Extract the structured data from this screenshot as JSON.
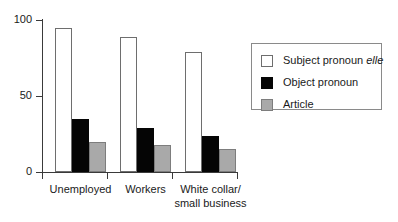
{
  "chart_data": {
    "type": "bar",
    "title": "",
    "subtitle": "",
    "xlabel": "",
    "ylabel": "",
    "ylim": [
      0,
      100
    ],
    "yticks": [
      0,
      50,
      100
    ],
    "ytick_labels": [
      "0",
      "50",
      "100"
    ],
    "grid": false,
    "legend_position": "right",
    "categories": [
      "Unemployed",
      "Workers",
      "White collar/\nsmall business"
    ],
    "series": [
      {
        "name": "Subject pronoun elle",
        "name_plain": "Subject pronoun ",
        "name_italic": "elle",
        "color": "#ffffff",
        "edge_color": "#6e6e6e",
        "values": [
          95,
          89,
          79
        ]
      },
      {
        "name": "Object pronoun",
        "name_plain": "Object pronoun",
        "name_italic": "",
        "color": "#050505",
        "edge_color": "#050505",
        "values": [
          35,
          29,
          24
        ]
      },
      {
        "name": "Article",
        "name_plain": "Article",
        "name_italic": "",
        "color": "#a9a9a9",
        "edge_color": "#7d7d7d",
        "values": [
          20,
          18,
          15
        ]
      }
    ]
  },
  "legend": {
    "entries": [
      {
        "label_plain": "Subject pronoun ",
        "label_italic": "elle"
      },
      {
        "label_plain": "Object pronoun",
        "label_italic": ""
      },
      {
        "label_plain": "Article",
        "label_italic": ""
      }
    ]
  }
}
